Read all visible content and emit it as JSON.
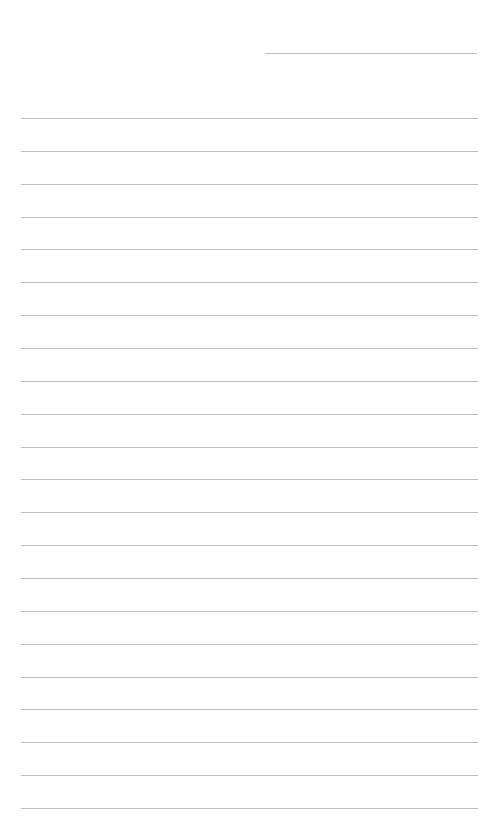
{
  "document": {
    "type": "lined-paper",
    "header_line": {
      "present": true
    },
    "line_count": 22,
    "line_color": "#bdbdbd",
    "background_color": "#ffffff"
  }
}
